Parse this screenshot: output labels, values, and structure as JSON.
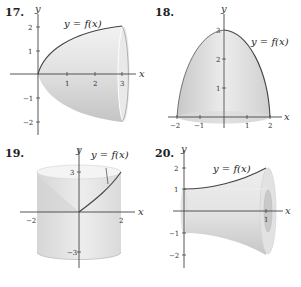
{
  "figures": [
    {
      "number": "17.",
      "function_label": "y = f(x)",
      "axis_labels": {
        "x": "x",
        "y": "y"
      },
      "x_ticks": [
        "1",
        "2",
        "3"
      ],
      "y_ticks": [
        "2",
        "1",
        "−1",
        "−2"
      ],
      "description": "Solid of revolution of y=f(x) (rising from 0 to 2 over [0,3]) about the x-axis"
    },
    {
      "number": "18.",
      "function_label": "y = f(x)",
      "axis_labels": {
        "x": "x",
        "y": "y"
      },
      "x_ticks": [
        "−2",
        "−1",
        "1",
        "2"
      ],
      "y_ticks": [
        "3",
        "2",
        "1"
      ],
      "description": "Dome-shaped solid obtained by revolving y=f(x) (from 3 at x=0 to 0 at x=2) about the y-axis"
    },
    {
      "number": "19.",
      "function_label": "y = f(x)",
      "axis_labels": {
        "x": "x",
        "y": "y"
      },
      "x_ticks": [
        "−2",
        "2"
      ],
      "y_ticks": [
        "3",
        "−3"
      ],
      "description": "Cylinder-shaped solid from revolving y=f(x) (from 0 to 3 over [0,2]) about the y-axis"
    },
    {
      "number": "20.",
      "function_label": "y = f(x)",
      "axis_labels": {
        "x": "x",
        "y": "y"
      },
      "x_ticks": [
        "1"
      ],
      "y_ticks": [
        "2",
        "1",
        "−1",
        "−2"
      ],
      "description": "Flared solid (trumpet shape) from revolving y=f(x) (from 1 to 2 over [0,1]) about the x-axis"
    }
  ]
}
